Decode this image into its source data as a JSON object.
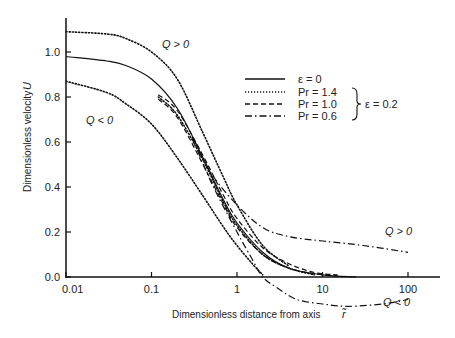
{
  "chart_data": {
    "type": "line",
    "title": "",
    "xlabel": "Dimensionless distance from axis",
    "xlabel_symbol": "r̃",
    "ylabel": "Dimensionless velocity",
    "ylabel_symbol": "U",
    "xscale": "log",
    "xlim": [
      0.01,
      200
    ],
    "ylim": [
      0.0,
      1.1
    ],
    "xticks": [
      "0.01",
      "0.1",
      "1",
      "10",
      "100"
    ],
    "yticks": [
      "0.0",
      "0.2",
      "0.4",
      "0.6",
      "0.8",
      "1.0"
    ],
    "grid": false,
    "legend_position": "upper right",
    "legend": {
      "entries": [
        {
          "style": "solid",
          "label": "ε = 0"
        },
        {
          "style": "dotted",
          "label": "Pr = 1.4"
        },
        {
          "style": "dashed",
          "label": "Pr = 1.0"
        },
        {
          "style": "dashdot",
          "label": "Pr = 0.6"
        }
      ],
      "group_label": "ε = 0.2"
    },
    "annotations": [
      {
        "text": "Q > 0",
        "x": 0.2,
        "y": 1.0
      },
      {
        "text": "Q < 0",
        "x": 0.015,
        "y": 0.75
      },
      {
        "text": "Q > 0",
        "x": 25,
        "y": 0.12
      },
      {
        "text": "Q < 0",
        "x": 20,
        "y": -0.12
      }
    ],
    "series": [
      {
        "name": "ε = 0",
        "style": "solid",
        "x": [
          0.01,
          0.03,
          0.05,
          0.1,
          0.2,
          0.4,
          0.7,
          1,
          2,
          4,
          10,
          25
        ],
        "y": [
          0.98,
          0.96,
          0.94,
          0.88,
          0.75,
          0.53,
          0.34,
          0.24,
          0.11,
          0.04,
          0.01,
          0.0
        ]
      },
      {
        "name": "Q > 0 (dotted, ε = 0)",
        "style": "dotted",
        "x": [
          0.01,
          0.03,
          0.05,
          0.1,
          0.2,
          0.4,
          0.7,
          1,
          2,
          4
        ],
        "y": [
          1.09,
          1.08,
          1.06,
          1.0,
          0.88,
          0.64,
          0.44,
          0.32,
          0.14,
          0.05
        ]
      },
      {
        "name": "Q < 0 (dotted, ε = 0)",
        "style": "dotted",
        "x": [
          0.01,
          0.03,
          0.05,
          0.1,
          0.2,
          0.4,
          0.7,
          1,
          1.5,
          2
        ],
        "y": [
          0.87,
          0.82,
          0.77,
          0.68,
          0.53,
          0.36,
          0.22,
          0.14,
          0.06,
          0.01
        ]
      },
      {
        "name": "Pr = 1.4",
        "style": "dotted",
        "x": [
          0.12,
          0.2,
          0.4,
          0.7,
          1,
          2,
          4,
          8
        ],
        "y": [
          0.8,
          0.72,
          0.52,
          0.33,
          0.23,
          0.1,
          0.04,
          0.01
        ]
      },
      {
        "name": "Pr = 1.0",
        "style": "dashed",
        "x": [
          0.12,
          0.2,
          0.4,
          0.7,
          1,
          2,
          4,
          8,
          15
        ],
        "y": [
          0.81,
          0.74,
          0.54,
          0.36,
          0.26,
          0.13,
          0.06,
          0.02,
          0.01
        ]
      },
      {
        "name": "Pr = 0.6",
        "style": "dashed",
        "x": [
          0.12,
          0.2,
          0.4,
          0.7,
          1,
          2,
          4,
          8,
          15
        ],
        "y": [
          0.79,
          0.71,
          0.5,
          0.32,
          0.22,
          0.1,
          0.04,
          0.015,
          0.005
        ]
      },
      {
        "name": "Q > 0 (dash-dot)",
        "style": "dashdot",
        "x": [
          0.3,
          0.5,
          1,
          2,
          4,
          10,
          30,
          100
        ],
        "y": [
          0.62,
          0.46,
          0.32,
          0.22,
          0.18,
          0.16,
          0.14,
          0.11
        ]
      },
      {
        "name": "Q < 0 (dash-dot)",
        "style": "dashdot",
        "x": [
          0.3,
          0.5,
          1,
          1.5,
          2,
          3,
          5,
          10,
          20,
          50,
          100
        ],
        "y": [
          0.62,
          0.42,
          0.2,
          0.08,
          0.0,
          -0.05,
          -0.1,
          -0.12,
          -0.13,
          -0.12,
          -0.1
        ]
      }
    ]
  }
}
